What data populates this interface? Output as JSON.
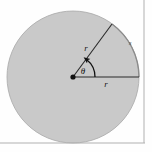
{
  "figure": {
    "background_color": "#fefefe",
    "border_color": "#b4b4b4"
  },
  "circle": {
    "name": "shaded-circle",
    "center_x": 73,
    "center_y": 77,
    "radius": 66,
    "fill_color": "#c9c9c9",
    "stroke_color": "#a8a8a8"
  },
  "center_point": {
    "name": "circle-center-dot",
    "x": 73,
    "y": 77,
    "radius": 2.6,
    "color": "#111111"
  },
  "radii": [
    {
      "id": "diagonal-radius",
      "label": "r",
      "from_x": 73,
      "from_y": 77,
      "to_x": 112,
      "to_y": 24,
      "label_x": 86,
      "label_y": 51,
      "color": "#2a2a2a"
    },
    {
      "id": "horizontal-radius",
      "label": "r",
      "from_x": 73,
      "from_y": 77,
      "to_x": 139,
      "to_y": 77,
      "label_x": 106,
      "label_y": 87,
      "color": "#2a2a2a"
    }
  ],
  "arc": {
    "id": "subtended-arc",
    "label": "s",
    "label_x": 130,
    "label_y": 45,
    "start_x": 112,
    "start_y": 24,
    "end_x": 139,
    "end_y": 77,
    "color": "#8c8c8c"
  },
  "angle": {
    "id": "central-angle",
    "label": "θ",
    "label_x": 83,
    "label_y": 74,
    "arc_radius": 22,
    "arrow_color": "#111111"
  },
  "border": {
    "right_line_x": 144,
    "bottom_line_y": 143,
    "color": "#b0b0b0"
  }
}
